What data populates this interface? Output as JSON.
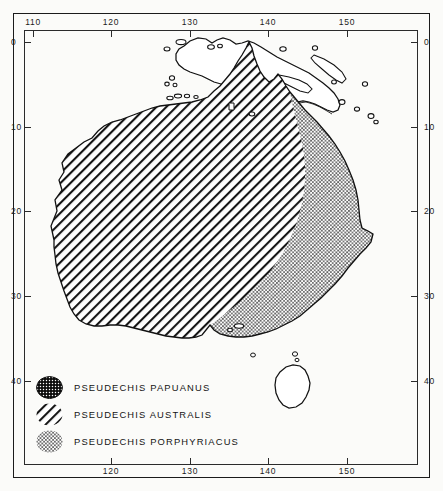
{
  "figure": {
    "kind": "distribution-map",
    "region": "Australia and New Guinea"
  },
  "axes": {
    "longitude_label_unit": "degrees east",
    "latitude_label_unit": "degrees south",
    "top_ticks": [
      "110",
      "120",
      "130",
      "140",
      "150"
    ],
    "bottom_ticks": [
      "120",
      "130",
      "140",
      "150"
    ],
    "left_ticks": [
      "0",
      "10",
      "20",
      "30",
      "40"
    ],
    "right_ticks": [
      "0",
      "10",
      "20",
      "30",
      "40"
    ]
  },
  "legend": {
    "items": [
      {
        "label": "PSEUDECHIS  PAPUANUS",
        "pattern": "dark-stipple",
        "swatch_name": "swatch-papuanus"
      },
      {
        "label": "PSEUDECHIS  AUSTRALIS",
        "pattern": "diagonal-hatch",
        "swatch_name": "swatch-australis"
      },
      {
        "label": "PSEUDECHIS  PORPHYRIACUS",
        "pattern": "light-stipple",
        "swatch_name": "swatch-porphyriacus"
      }
    ]
  },
  "colors": {
    "ink": "#1b1b1b",
    "frame": "#2b2b2b",
    "paper": "#fbfbf9",
    "hatch": "#161616",
    "stipple_dark": "#0d0d0d",
    "stipple_light": "#2a2a2a"
  }
}
